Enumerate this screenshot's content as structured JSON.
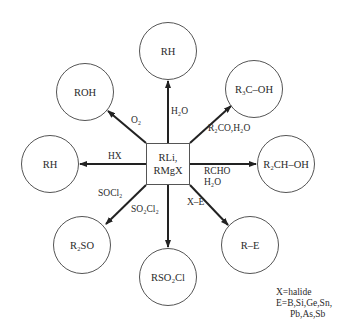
{
  "center": {
    "line1": "RLi,",
    "line2": "RMgX"
  },
  "products": [
    {
      "id": "top",
      "label": "RH",
      "reagent": "H₂O"
    },
    {
      "id": "upper-left",
      "label": "ROH",
      "reagent": "O₂"
    },
    {
      "id": "upper-right",
      "label": "R₃C–OH",
      "reagent": "R₂CO,H₂O"
    },
    {
      "id": "left",
      "label": "RH",
      "reagent": "HX"
    },
    {
      "id": "right",
      "label": "R₂CH–OH",
      "reagent_line1": "RCHO",
      "reagent_line2": "H₂O"
    },
    {
      "id": "lower-left",
      "label": "R₂SO",
      "reagent": "SOCl₂"
    },
    {
      "id": "bottom",
      "label": "RSO₂Cl",
      "reagent": "SO₂Cl₂"
    },
    {
      "id": "lower-right",
      "label": "R–E",
      "reagent": "X–E"
    }
  ],
  "legend": {
    "line1": "X=halide",
    "line2": "E=B,Si,Ge,Sn,",
    "line3": "Pb,As,Sb"
  }
}
